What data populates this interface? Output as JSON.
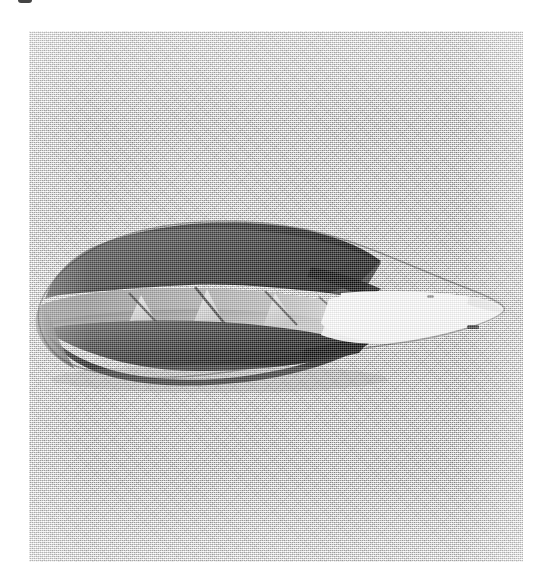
{
  "figure": {
    "caption_fragment": "",
    "panel_label": "rendered-3d-model",
    "background_color": "#d5d5d5",
    "panel_bounds": {
      "x": 29,
      "y": 31,
      "width": 494,
      "height": 531
    }
  },
  "model": {
    "name": "faceted leaf-shaped blade",
    "description": "Shaded 3D polygonal surface model of an elongated pointed leaf / blade form, lit from the right, rendered in grayscale on a flat gray background.",
    "orientation": "horizontal, tip pointing right",
    "colors": {
      "highlight_tip": "#ffffff",
      "light_facet": "#f2f2f2",
      "mid_facet": "#9a9a9a",
      "mid_dark_facet": "#6e6e6e",
      "dark_facet": "#3c3c3c",
      "deep_shadow": "#141414",
      "outline": "#2a2a2a"
    },
    "extent": {
      "x": 38,
      "y": 222,
      "width": 465,
      "height": 145
    }
  }
}
